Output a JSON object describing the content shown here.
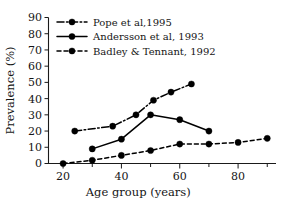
{
  "chart_data": {
    "type": "line",
    "title": "",
    "xlabel": "Age group (years)",
    "ylabel": "Prevalence (%)",
    "xlim": [
      15,
      93
    ],
    "ylim": [
      0,
      90
    ],
    "xticks": [
      20,
      40,
      60,
      80
    ],
    "yticks": [
      0,
      10,
      20,
      30,
      40,
      50,
      60,
      70,
      80,
      90
    ],
    "grid": false,
    "legend_position": "top-left",
    "series": [
      {
        "name": "Pope et al,1995",
        "style": "dash-dot",
        "marker": "filled-circle",
        "x": [
          24,
          37,
          45,
          51,
          57,
          64
        ],
        "y": [
          20,
          23,
          30,
          39,
          44,
          49
        ]
      },
      {
        "name": "Andersson et al, 1993",
        "style": "solid",
        "marker": "filled-circle",
        "x": [
          30,
          40,
          50,
          60,
          70
        ],
        "y": [
          9,
          15,
          30,
          27,
          20
        ]
      },
      {
        "name": "Badley & Tennant, 1992",
        "style": "dashed",
        "marker": "filled-circle",
        "x": [
          20,
          30,
          40,
          50,
          60,
          70,
          80,
          90
        ],
        "y": [
          0,
          2,
          5,
          8,
          12,
          12,
          13,
          15.5
        ]
      }
    ]
  },
  "axes": {
    "y_title": "Prevalence (%)",
    "x_title": "Age group (years)",
    "y_tick_labels": [
      "0",
      "10",
      "20",
      "30",
      "40",
      "50",
      "60",
      "70",
      "80",
      "90"
    ],
    "x_tick_labels": [
      "20",
      "40",
      "60",
      "80"
    ]
  },
  "legend": {
    "entries": [
      {
        "label": "Pope et al,1995",
        "style": "dash-dot"
      },
      {
        "label": "Andersson et al, 1993",
        "style": "solid"
      },
      {
        "label": "Badley & Tennant, 1992",
        "style": "dashed"
      }
    ]
  },
  "colors": {
    "ink": "#141414",
    "background": "#ffffff"
  }
}
